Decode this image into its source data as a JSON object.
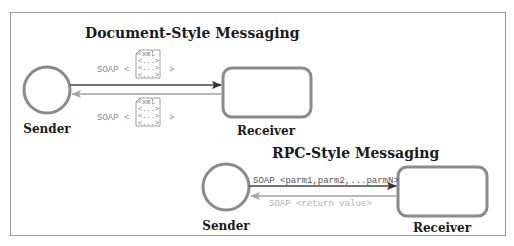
{
  "colors": {
    "frame": "#9a9a9a",
    "shape_stroke": "#8a8a8a",
    "arrow_forward": "#444444",
    "arrow_return": "#a0a0a0",
    "text_dark": "#1a1a1a",
    "text_muted": "#888888",
    "text_light": "#b0b0b0"
  },
  "document_style": {
    "title": "Document-Style Messaging",
    "request": {
      "prefix": "SOAP <",
      "suffix": ">",
      "doc": {
        "tag": "xml",
        "lines": [
          "<...>",
          "<...>",
          "<...>"
        ]
      }
    },
    "response": {
      "prefix": "SOAP <",
      "suffix": ">",
      "doc": {
        "tag": "xml",
        "lines": [
          "<...>",
          "<...>",
          "<...>"
        ]
      }
    },
    "sender_label": "Sender",
    "receiver_label": "Receiver"
  },
  "rpc_style": {
    "title": "RPC-Style Messaging",
    "request_label": "SOAP <parm1,parm2,...parmN>",
    "response_label": "SOAP <return value>",
    "sender_label": "Sender",
    "receiver_label": "Receiver"
  }
}
